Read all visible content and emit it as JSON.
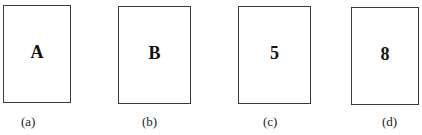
{
  "figure": {
    "cards": [
      {
        "face": "A",
        "caption": "(a)"
      },
      {
        "face": "B",
        "caption": "(b)"
      },
      {
        "face": "5",
        "caption": "(c)"
      },
      {
        "face": "8",
        "caption": "(d)"
      }
    ]
  }
}
